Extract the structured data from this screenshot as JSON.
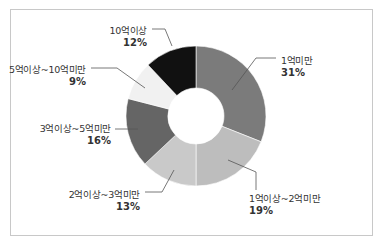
{
  "chart_data": {
    "type": "pie",
    "subtype": "donut",
    "title": "",
    "start_angle_deg": 0,
    "direction": "clockwise",
    "slices": [
      {
        "label": "1억미만",
        "value": 31,
        "display": "31%",
        "color": "#7b7b7b"
      },
      {
        "label": "1억이상~2억미만",
        "value": 19,
        "display": "19%",
        "color": "#bdbdbd"
      },
      {
        "label": "2억이상~3억미만",
        "value": 13,
        "display": "13%",
        "color": "#c9c9c9"
      },
      {
        "label": "3억이상~5억미만",
        "value": 16,
        "display": "16%",
        "color": "#656565"
      },
      {
        "label": "5억이상~10억미만",
        "value": 9,
        "display": "9%",
        "color": "#f1f1f1"
      },
      {
        "label": "10억이상",
        "value": 12,
        "display": "12%",
        "color": "#111111"
      }
    ],
    "legend": "none (callout labels with leader lines)"
  }
}
